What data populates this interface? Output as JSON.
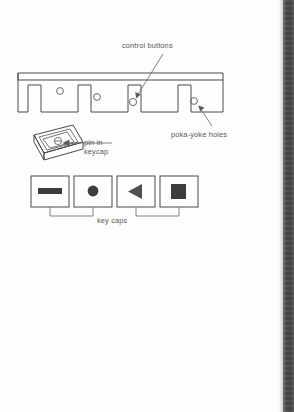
{
  "page": {
    "kind": "scanned-technical-diagram",
    "background_color": "#fdfdfd",
    "ink_color": "#4a4a4a",
    "text_color": "#585858",
    "gutter_color": "#3e3e3e",
    "width": 294,
    "height": 412
  },
  "labels": {
    "control_buttons": "control buttons",
    "poka_yoke_holes": "poka-yoke holes",
    "pin_in_keycap_line1": "pin in",
    "pin_in_keycap_line2": "keycap",
    "key_caps": "key caps"
  },
  "diagram": {
    "panel": {
      "name": "control-panel-rail",
      "description": "sheet-metal rail in section with four rectangular notches and four small round holes",
      "hole_count": 4,
      "notch_count": 4
    },
    "keycap_detail": {
      "name": "keycap-isometric",
      "description": "tilted isometric keycap with nested rim and a small pin circle at centre",
      "pin_symbol": "circle-with-bar"
    },
    "keycaps": [
      {
        "name": "keycap-dash",
        "glyph": "dash-bar-icon"
      },
      {
        "name": "keycap-circle",
        "glyph": "filled-circle-icon"
      },
      {
        "name": "keycap-triangle",
        "glyph": "left-triangle-icon"
      },
      {
        "name": "keycap-square",
        "glyph": "filled-square-icon"
      }
    ]
  }
}
